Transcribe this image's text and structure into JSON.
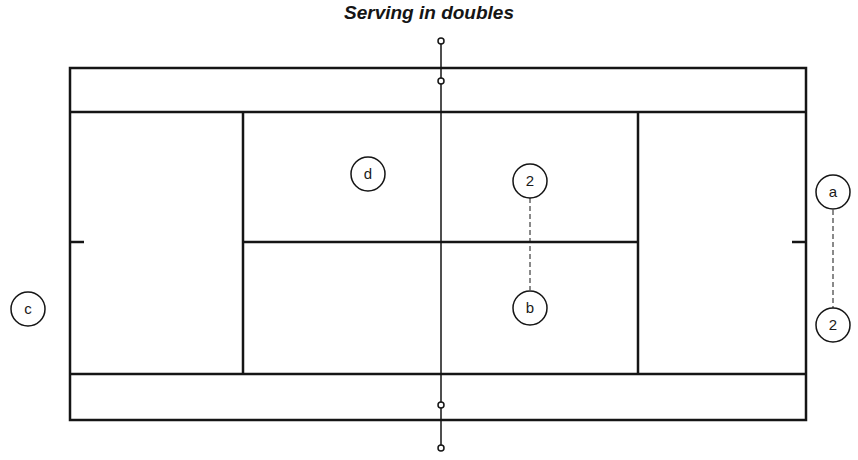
{
  "title": "Serving in doubles",
  "colors": {
    "line": "#151515",
    "background": "#ffffff"
  },
  "players": [
    {
      "id": "d",
      "label": "d"
    },
    {
      "id": "c",
      "label": "c"
    },
    {
      "id": "a",
      "label": "a"
    },
    {
      "id": "b",
      "label": "b"
    },
    {
      "id": "pos2-right",
      "label": "2"
    },
    {
      "id": "pos2-near-b",
      "label": "2"
    }
  ]
}
